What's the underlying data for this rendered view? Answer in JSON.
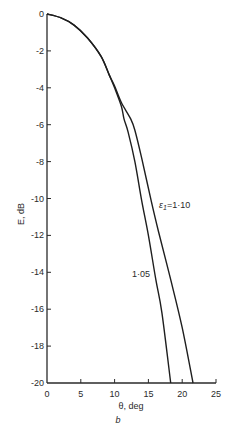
{
  "chart_data": {
    "type": "line",
    "title": "",
    "panel_label": "b",
    "xlabel": "θ, deg",
    "ylabel": "E, dB",
    "xlim": [
      0,
      25
    ],
    "ylim": [
      -20,
      0
    ],
    "xticks": [
      0,
      5,
      10,
      15,
      20,
      25
    ],
    "yticks": [
      0,
      -2,
      -4,
      -6,
      -8,
      -10,
      -12,
      -14,
      -16,
      -18,
      -20
    ],
    "xtick_labels": [
      "0",
      "5",
      "10",
      "15",
      "20",
      "25"
    ],
    "ytick_labels": [
      "0",
      "-2",
      "-4",
      "-6",
      "-8",
      "-10",
      "-12",
      "-14",
      "-16",
      "-18",
      "-20"
    ],
    "grid": false,
    "series": [
      {
        "name": "1·05",
        "label": "1·05",
        "x": [
          0,
          2,
          4,
          6,
          8,
          9.2,
          10,
          11,
          11.4,
          12,
          13,
          14,
          15,
          16.1,
          17,
          18.3
        ],
        "y": [
          0,
          -0.2,
          -0.6,
          -1.3,
          -2.3,
          -3.3,
          -4.0,
          -5.0,
          -5.7,
          -6.4,
          -8.0,
          -10.1,
          -12.0,
          -14.4,
          -16.2,
          -20
        ]
      },
      {
        "name": "ε1=1·10",
        "label": "ε",
        "label_sub": "1",
        "label_rest": "=1·10",
        "x": [
          0,
          2,
          4,
          6,
          8,
          9.2,
          10,
          11,
          12.4,
          13,
          14,
          15.4,
          16.5,
          18.3,
          20,
          21.6
        ],
        "y": [
          0,
          -0.2,
          -0.6,
          -1.3,
          -2.3,
          -3.3,
          -3.9,
          -4.8,
          -5.7,
          -6.3,
          -7.8,
          -10.1,
          -11.8,
          -14.4,
          -17.0,
          -20
        ]
      }
    ]
  }
}
